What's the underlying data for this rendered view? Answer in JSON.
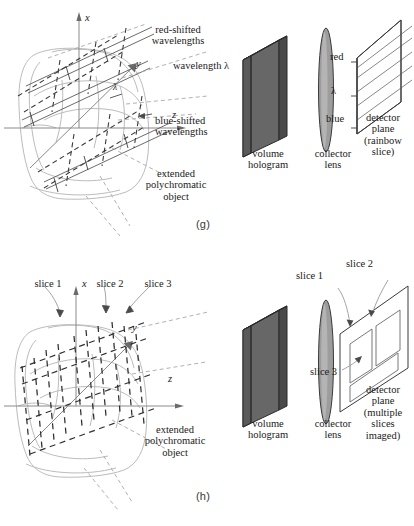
{
  "figure": {
    "caption_tags": {
      "panel_g": "(g)",
      "panel_h": "(h)"
    },
    "colors": {
      "ink": "#1a1a1a",
      "hologram_face": "#6e6e6e",
      "hologram_side": "#555555",
      "hologram_top": "#3f3f3f",
      "lens_fill": "#9a9a9a",
      "object_outline": "#b9b9b9",
      "axis_line": "#8a8a8a",
      "dashed_ray": "#9b9b9b",
      "detector_line": "#6a6a6a"
    }
  },
  "panel_g": {
    "tag": "(g)",
    "axes": {
      "x": "x",
      "y": "y",
      "z": "z"
    },
    "labels": {
      "red_shifted": "red-shifted\nwavelengths",
      "wavelength": "wavelength λ",
      "blue_shifted": "blue-shifted\nwavelengths",
      "object": "extended\npolychromatic\nobject",
      "lambda_axis": "λ"
    },
    "optics": {
      "hologram": "volume\nhologram",
      "lens": "collector\nlens",
      "detector": "detector\nplane\n(rainbow\nslice)",
      "detector_red": "red",
      "detector_lambda": "λ",
      "detector_blue": "blue"
    }
  },
  "panel_h": {
    "tag": "(h)",
    "axes": {
      "x": "x",
      "y": "y",
      "z": "z"
    },
    "labels": {
      "slice_1": "slice 1",
      "slice_2": "slice 2",
      "slice_3": "slice 3",
      "object": "extended\npolychromatic\nobject"
    },
    "optics": {
      "hologram": "volume\nhologram",
      "lens": "collector\nlens",
      "detector": "detector\nplane\n(multiple\nslices\nimaged)",
      "detector_slice_1": "slice 1",
      "detector_slice_2": "slice 2",
      "detector_slice_3": "slice 3"
    }
  }
}
